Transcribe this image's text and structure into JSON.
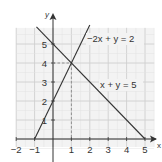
{
  "chart_data": {
    "type": "line",
    "title": "",
    "xlabel": "x",
    "ylabel": "y",
    "xlim": [
      -2,
      5.5
    ],
    "ylim": [
      0,
      5.8
    ],
    "grid": true,
    "x_ticks": [
      "-2",
      "-1",
      "1",
      "2",
      "3",
      "4",
      "5"
    ],
    "y_ticks": [
      "1",
      "2",
      "3",
      "4",
      "5"
    ],
    "series": [
      {
        "name": "-2x + y = 2",
        "label": "−2x + y = 2",
        "x": [
          -1,
          2
        ],
        "y": [
          0,
          6
        ]
      },
      {
        "name": "x + y = 5",
        "label": "x + y = 5",
        "x": [
          -0.9,
          5
        ],
        "y": [
          5.9,
          0
        ]
      }
    ],
    "annotations": [
      {
        "type": "intersection",
        "point": [
          1,
          4
        ],
        "guides": "dashed lines to x=1 and y=4"
      }
    ]
  }
}
